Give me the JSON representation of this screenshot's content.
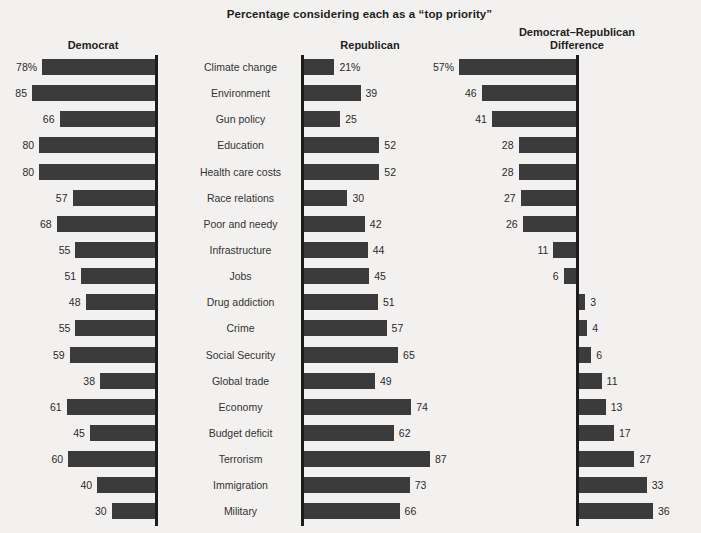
{
  "title": "Percentage considering each as a “top priority”",
  "headers": {
    "democrat": "Democrat",
    "republican": "Republican",
    "difference_line1": "Democrat–Republican",
    "difference_line2": "Difference"
  },
  "colors": {
    "bar": "#3b3b3b",
    "axis": "#1d1d1d",
    "background": "#f2f1ef",
    "text": "#2f2f2f"
  },
  "chart_data": {
    "type": "bar",
    "title": "Percentage considering each as a “top priority”",
    "xlabel": "",
    "ylabel": "",
    "grid": false,
    "legend_position": "none",
    "orientation": "horizontal",
    "panels": [
      "Democrat",
      "Republican",
      "Democrat–Republican Difference"
    ],
    "axis_ranges": {
      "democrat": [
        0,
        90
      ],
      "republican": [
        0,
        90
      ],
      "difference": [
        -36,
        57
      ]
    },
    "categories": [
      "Climate change",
      "Environment",
      "Gun policy",
      "Education",
      "Health care costs",
      "Race relations",
      "Poor and needy",
      "Infrastructure",
      "Jobs",
      "Drug addiction",
      "Crime",
      "Social Security",
      "Global trade",
      "Economy",
      "Budget deficit",
      "Terrorism",
      "Immigration",
      "Military"
    ],
    "series": [
      {
        "name": "Democrat",
        "values": [
          78,
          85,
          66,
          80,
          80,
          57,
          68,
          55,
          51,
          48,
          55,
          59,
          38,
          61,
          45,
          60,
          40,
          30
        ]
      },
      {
        "name": "Republican",
        "values": [
          21,
          39,
          25,
          52,
          52,
          30,
          42,
          44,
          45,
          51,
          57,
          65,
          49,
          74,
          62,
          87,
          73,
          66
        ]
      },
      {
        "name": "Democrat–Republican Difference",
        "values": [
          57,
          46,
          41,
          28,
          28,
          27,
          26,
          11,
          6,
          -3,
          -4,
          -6,
          -11,
          -13,
          -17,
          -27,
          -33,
          -36
        ]
      }
    ]
  },
  "rows": [
    {
      "label": "Climate change",
      "dem": 78,
      "dem_text": "78%",
      "rep": 21,
      "rep_text": "21%",
      "diff": 57,
      "diff_text": "57%"
    },
    {
      "label": "Environment",
      "dem": 85,
      "dem_text": "85",
      "rep": 39,
      "rep_text": "39",
      "diff": 46,
      "diff_text": "46"
    },
    {
      "label": "Gun policy",
      "dem": 66,
      "dem_text": "66",
      "rep": 25,
      "rep_text": "25",
      "diff": 41,
      "diff_text": "41"
    },
    {
      "label": "Education",
      "dem": 80,
      "dem_text": "80",
      "rep": 52,
      "rep_text": "52",
      "diff": 28,
      "diff_text": "28"
    },
    {
      "label": "Health care costs",
      "dem": 80,
      "dem_text": "80",
      "rep": 52,
      "rep_text": "52",
      "diff": 28,
      "diff_text": "28"
    },
    {
      "label": "Race relations",
      "dem": 57,
      "dem_text": "57",
      "rep": 30,
      "rep_text": "30",
      "diff": 27,
      "diff_text": "27"
    },
    {
      "label": "Poor and needy",
      "dem": 68,
      "dem_text": "68",
      "rep": 42,
      "rep_text": "42",
      "diff": 26,
      "diff_text": "26"
    },
    {
      "label": "Infrastructure",
      "dem": 55,
      "dem_text": "55",
      "rep": 44,
      "rep_text": "44",
      "diff": 11,
      "diff_text": "11"
    },
    {
      "label": "Jobs",
      "dem": 51,
      "dem_text": "51",
      "rep": 45,
      "rep_text": "45",
      "diff": 6,
      "diff_text": "6"
    },
    {
      "label": "Drug addiction",
      "dem": 48,
      "dem_text": "48",
      "rep": 51,
      "rep_text": "51",
      "diff": -3,
      "diff_text": "3"
    },
    {
      "label": "Crime",
      "dem": 55,
      "dem_text": "55",
      "rep": 57,
      "rep_text": "57",
      "diff": -4,
      "diff_text": "4"
    },
    {
      "label": "Social Security",
      "dem": 59,
      "dem_text": "59",
      "rep": 65,
      "rep_text": "65",
      "diff": -6,
      "diff_text": "6"
    },
    {
      "label": "Global trade",
      "dem": 38,
      "dem_text": "38",
      "rep": 49,
      "rep_text": "49",
      "diff": -11,
      "diff_text": "11"
    },
    {
      "label": "Economy",
      "dem": 61,
      "dem_text": "61",
      "rep": 74,
      "rep_text": "74",
      "diff": -13,
      "diff_text": "13"
    },
    {
      "label": "Budget deficit",
      "dem": 45,
      "dem_text": "45",
      "rep": 62,
      "rep_text": "62",
      "diff": -17,
      "diff_text": "17"
    },
    {
      "label": "Terrorism",
      "dem": 60,
      "dem_text": "60",
      "rep": 87,
      "rep_text": "87",
      "diff": -27,
      "diff_text": "27"
    },
    {
      "label": "Immigration",
      "dem": 40,
      "dem_text": "40",
      "rep": 73,
      "rep_text": "73",
      "diff": -33,
      "diff_text": "33"
    },
    {
      "label": "Military",
      "dem": 30,
      "dem_text": "30",
      "rep": 66,
      "rep_text": "66",
      "diff": -36,
      "diff_text": "36"
    }
  ]
}
